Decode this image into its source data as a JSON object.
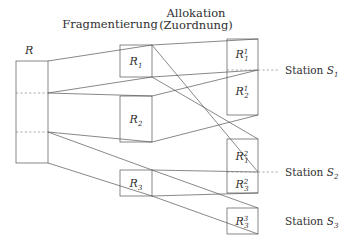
{
  "figure": {
    "title_left": "Fragmentierung",
    "title_right_line1": "Allokation",
    "title_right_line2": "(Zuordnung)",
    "colors": {
      "line": "#555555",
      "dashed": "#8a8a7a",
      "text": "#303030",
      "background": "#ffffff"
    }
  },
  "relation": {
    "label": "R"
  },
  "fragments": [
    {
      "base": "R",
      "sub": "1"
    },
    {
      "base": "R",
      "sub": "2"
    },
    {
      "base": "R",
      "sub": "3"
    }
  ],
  "allocations": [
    {
      "base": "R",
      "sub": "1",
      "sup": "1"
    },
    {
      "base": "R",
      "sub": "2",
      "sup": "1"
    },
    {
      "base": "R",
      "sub": "1",
      "sup": "2"
    },
    {
      "base": "R",
      "sub": "3",
      "sup": "2"
    },
    {
      "base": "R",
      "sub": "3",
      "sup": "3"
    }
  ],
  "stations": [
    {
      "prefix": "Station",
      "base": "S",
      "sub": "1"
    },
    {
      "prefix": "Station",
      "base": "S",
      "sub": "2"
    },
    {
      "prefix": "Station",
      "base": "S",
      "sub": "3"
    }
  ]
}
